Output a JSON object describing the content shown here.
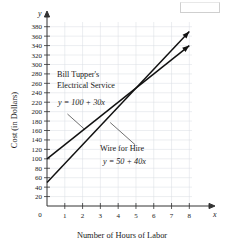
{
  "chart_data": {
    "type": "line",
    "title": "",
    "xlabel": "Number of Hours of Labor",
    "ylabel": "Cost (in Dollars)",
    "xlim": [
      0,
      8.6
    ],
    "ylim": [
      0,
      390
    ],
    "grid": true,
    "legend": "annotations-on-plot",
    "x_ticks": [
      0,
      1,
      2,
      3,
      4,
      5,
      6,
      7,
      8
    ],
    "y_ticks": [
      20,
      40,
      60,
      80,
      100,
      120,
      140,
      160,
      180,
      200,
      220,
      240,
      260,
      280,
      300,
      320,
      340,
      360,
      380
    ],
    "x_axis_symbol": "x",
    "y_axis_symbol": "y",
    "origin_label": "0",
    "series": [
      {
        "name": "Bill Tupper's Electrical Service",
        "equation": "y = 100 + 30x",
        "intercept": 100,
        "slope": 30,
        "x": [
          0,
          8
        ],
        "values": [
          100,
          340
        ],
        "arrow_end": true
      },
      {
        "name": "Wire for Hire",
        "equation": "y = 50 + 40x",
        "intercept": 50,
        "slope": 40,
        "x": [
          0,
          8
        ],
        "values": [
          50,
          370
        ],
        "arrow_end": true
      }
    ],
    "intersection": {
      "x": 5,
      "y": 250
    },
    "annotations": [
      {
        "id": "bill-tupper",
        "line1": "Bill Tupper's",
        "line2": "Electrical Service",
        "equation": "y = 100 + 30x"
      },
      {
        "id": "wire-for-hire",
        "line1": "Wire for Hire",
        "equation": "y = 50 + 40x"
      }
    ]
  },
  "ticks": {
    "x": [
      "1",
      "2",
      "3",
      "4",
      "5",
      "6",
      "7",
      "8"
    ],
    "y": [
      "380",
      "360",
      "340",
      "320",
      "300",
      "280",
      "260",
      "240",
      "220",
      "200",
      "180",
      "160",
      "140",
      "120",
      "100",
      "80",
      "60",
      "40",
      "20"
    ]
  },
  "labels": {
    "origin": "0",
    "x_symbol": "x",
    "y_symbol": "y",
    "x_caption": "Number of Hours of Labor",
    "y_caption": "Cost (in Dollars)"
  },
  "annotations": {
    "a1_line1": "Bill Tupper's",
    "a1_line2": "Electrical Service",
    "a1_eq": "y = 100 + 30x",
    "a2_line1": "Wire for Hire",
    "a2_eq": "y = 50 + 40x"
  },
  "colors": {
    "line": "#111111",
    "grid": "#d8dde3",
    "axis": "#333333",
    "background": "#ffffff"
  }
}
